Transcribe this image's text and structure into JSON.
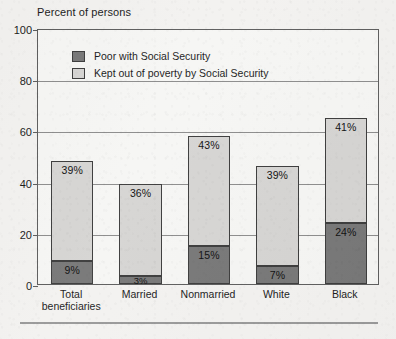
{
  "chart_data": {
    "type": "bar",
    "subtype": "stacked-bar",
    "title": "",
    "ylabel": "Percent of persons",
    "xlabel": "",
    "ylim": [
      0,
      100
    ],
    "yticks": [
      0,
      20,
      40,
      60,
      80,
      100
    ],
    "ytick_labels": [
      "0",
      "20",
      "40",
      "60",
      "80",
      "100"
    ],
    "grid": true,
    "grid_axis": "y",
    "legend_position": "upper-left-inside",
    "categories": [
      "Total beneficiaries",
      "Married",
      "Nonmarried",
      "White",
      "Black"
    ],
    "category_lines": [
      [
        "Total",
        "beneficiaries"
      ],
      [
        "Married"
      ],
      [
        "Nonmarried"
      ],
      [
        "White"
      ],
      [
        "Black"
      ]
    ],
    "series": [
      {
        "name": "Poor with Social Security",
        "color": "#787878",
        "values": [
          9,
          3,
          15,
          7,
          24
        ],
        "value_labels": [
          "9%",
          "3%",
          "15%",
          "7%",
          "24%"
        ]
      },
      {
        "name": "Kept out of poverty by Social Security",
        "color": "#d6d5d3",
        "values": [
          39,
          36,
          43,
          39,
          41
        ],
        "value_labels": [
          "39%",
          "36%",
          "43%",
          "39%",
          "41%"
        ]
      }
    ],
    "totals": [
      48,
      39,
      58,
      46,
      65
    ]
  },
  "figure": {
    "axis_title": "Percent of persons",
    "legend": [
      {
        "label": "Poor with Social Security",
        "swatch": "dark"
      },
      {
        "label": "Kept out of poverty by Social Security",
        "swatch": "light"
      }
    ],
    "footer_ghost_text": ""
  }
}
